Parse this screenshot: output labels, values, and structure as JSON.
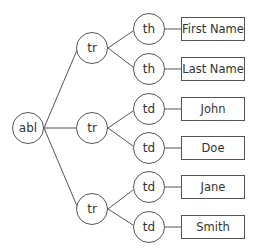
{
  "diagram": {
    "type": "tree",
    "root": {
      "label": "abl"
    },
    "rows": [
      {
        "label": "tr",
        "cells": [
          {
            "label": "th",
            "value": "First Name"
          },
          {
            "label": "th",
            "value": "Last Name"
          }
        ]
      },
      {
        "label": "tr",
        "cells": [
          {
            "label": "td",
            "value": "John"
          },
          {
            "label": "td",
            "value": "Doe"
          }
        ]
      },
      {
        "label": "tr",
        "cells": [
          {
            "label": "td",
            "value": "Jane"
          },
          {
            "label": "td",
            "value": "Smith"
          }
        ]
      }
    ],
    "colors": {
      "stroke": "#555555",
      "text": "#333333",
      "background": "#ffffff"
    }
  }
}
